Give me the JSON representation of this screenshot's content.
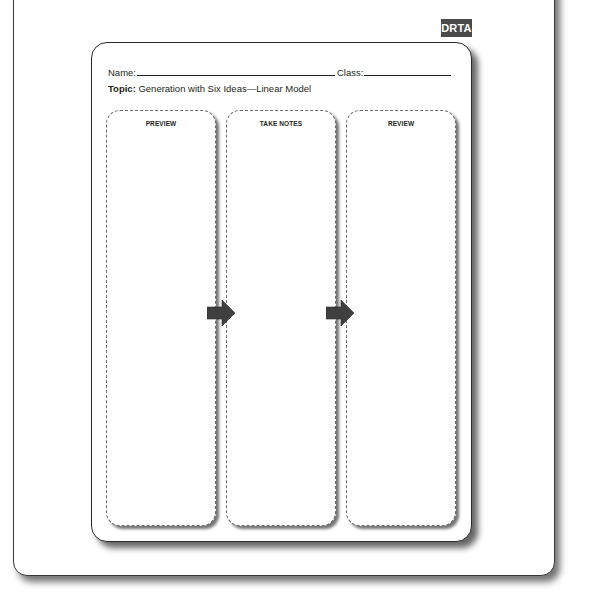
{
  "badge": {
    "label": "DRTA",
    "background": "#4a4a4a",
    "text_color": "#ffffff"
  },
  "worksheet": {
    "name_label": "Name:",
    "class_label": "Class:",
    "topic_label": "Topic:",
    "topic_value": "Generation with Six Ideas—Linear Model",
    "columns": [
      {
        "title": "PREVIEW"
      },
      {
        "title": "TAKE NOTES"
      },
      {
        "title": "REVIEW"
      }
    ],
    "arrows": [
      {
        "icon": "arrow-right-icon",
        "from": "PREVIEW",
        "to": "TAKE NOTES"
      },
      {
        "icon": "arrow-right-icon",
        "from": "TAKE NOTES",
        "to": "REVIEW"
      }
    ],
    "arrow_color": "#3f3f3f"
  }
}
